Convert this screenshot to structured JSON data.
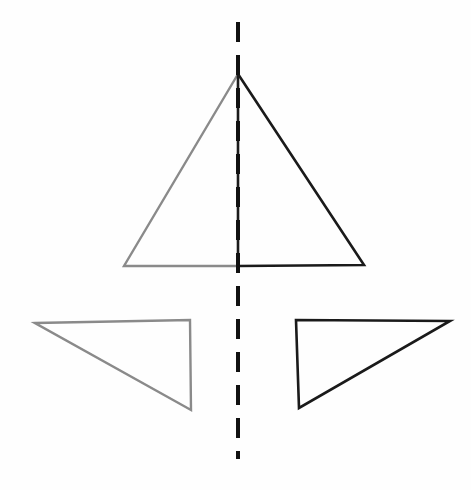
{
  "canvas": {
    "width": 471,
    "height": 490,
    "background_color": "#fefefe",
    "title": "Reflection symmetry diagram"
  },
  "colors": {
    "pre_image_gray": "#8a8a8a",
    "image_black": "#1a1a1a",
    "mirror_line": "#111111",
    "background": "#fefefe"
  },
  "chart_data": {
    "type": "diagram",
    "subtitle": "",
    "xlabel": "",
    "ylabel": "",
    "grid": false,
    "legend": "none",
    "axis_of_symmetry": {
      "name": "vertical-dashed-mirror-line",
      "orientation": "vertical",
      "x": 238,
      "y_start": 22,
      "y_end": 459,
      "dash_length": 20,
      "gap_length": 13,
      "stroke_width": 4,
      "color": "#111111"
    },
    "shapes": [
      {
        "name": "large-triangle-left-half",
        "role": "pre-image",
        "color": "#8a8a8a",
        "stroke_width": 2.4,
        "closed": false,
        "points": [
          [
            238,
            74
          ],
          [
            124,
            266
          ],
          [
            238,
            266
          ]
        ]
      },
      {
        "name": "large-triangle-right-half",
        "role": "image",
        "color": "#1a1a1a",
        "stroke_width": 2.6,
        "closed": false,
        "points": [
          [
            238,
            74
          ],
          [
            364,
            265
          ],
          [
            238,
            266
          ]
        ]
      },
      {
        "name": "large-triangle-altitude",
        "role": "axis-segment",
        "color": "#1a1a1a",
        "stroke_width": 2.6,
        "closed": false,
        "points": [
          [
            238,
            74
          ],
          [
            238,
            266
          ]
        ]
      },
      {
        "name": "lower-left-right-triangle",
        "role": "pre-image",
        "color": "#8a8a8a",
        "stroke_width": 2.4,
        "closed": true,
        "points": [
          [
            35,
            323
          ],
          [
            190,
            320
          ],
          [
            191,
            410
          ]
        ]
      },
      {
        "name": "lower-right-right-triangle",
        "role": "image",
        "color": "#1a1a1a",
        "stroke_width": 2.6,
        "closed": true,
        "points": [
          [
            450,
            321
          ],
          [
            296,
            320
          ],
          [
            299,
            408
          ]
        ]
      }
    ],
    "annotations": []
  }
}
